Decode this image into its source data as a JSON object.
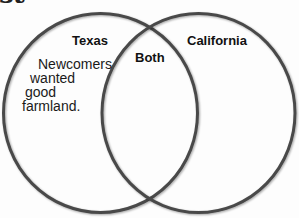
{
  "heading_fragment": "st",
  "diagram": {
    "type": "venn",
    "circle_color": "#555555",
    "sets": [
      {
        "label": "Texas",
        "items": [
          "Newcomers wanted good farmland."
        ],
        "lines": [
          "Newcomers",
          "wanted",
          "good",
          "farmland."
        ]
      },
      {
        "label": "Both",
        "items": []
      },
      {
        "label": "California",
        "items": []
      }
    ]
  }
}
